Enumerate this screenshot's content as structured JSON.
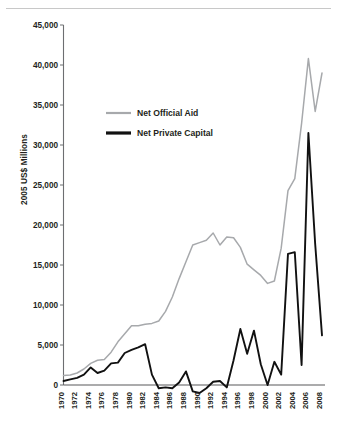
{
  "chart_data": {
    "type": "line",
    "title": "",
    "xlabel": "",
    "ylabel": "2005 US$ Millions",
    "xlim": [
      1970,
      2008
    ],
    "ylim": [
      -1500,
      45000
    ],
    "yticks": [
      0,
      5000,
      10000,
      15000,
      20000,
      25000,
      30000,
      35000,
      40000,
      45000
    ],
    "ytick_labels": [
      "0",
      "5,000",
      "10,000",
      "15,000",
      "20,000",
      "25,000",
      "30,000",
      "35,000",
      "40,000",
      "45,000"
    ],
    "xticks": [
      1970,
      1972,
      1974,
      1976,
      1978,
      1980,
      1982,
      1984,
      1986,
      1988,
      1990,
      1992,
      1994,
      1996,
      1998,
      2000,
      2002,
      2004,
      2006,
      2008
    ],
    "xtick_labels": [
      "1970",
      "1972",
      "1974",
      "1976",
      "1978",
      "1980",
      "1982",
      "1984",
      "1986",
      "1988",
      "1990",
      "1992",
      "1994",
      "1996",
      "1998",
      "2000",
      "2002",
      "2004",
      "2006",
      "2008"
    ],
    "grid": false,
    "legend_position": "upper-left-inside",
    "x": [
      1970,
      1971,
      1972,
      1973,
      1974,
      1975,
      1976,
      1977,
      1978,
      1979,
      1980,
      1981,
      1982,
      1983,
      1984,
      1985,
      1986,
      1987,
      1988,
      1989,
      1990,
      1991,
      1992,
      1993,
      1994,
      1995,
      1996,
      1997,
      1998,
      1999,
      2000,
      2001,
      2002,
      2003,
      2004,
      2005,
      2006,
      2007,
      2008
    ],
    "series": [
      {
        "name": "Net Official Aid",
        "color": "#a7a9ac",
        "values": [
          1200,
          1250,
          1500,
          2000,
          2700,
          3100,
          3200,
          4100,
          5400,
          6400,
          7400,
          7400,
          7600,
          7700,
          8000,
          9200,
          11000,
          13300,
          15400,
          17500,
          17800,
          18100,
          19000,
          17500,
          18500,
          18400,
          17200,
          15100,
          14400,
          13700,
          12700,
          13000,
          17100,
          24300,
          25800,
          32700,
          40800,
          34200,
          39000
        ]
      },
      {
        "name": "Net Private Capital",
        "color": "#111111",
        "values": [
          500,
          700,
          900,
          1300,
          2200,
          1500,
          1800,
          2700,
          2800,
          4000,
          4400,
          4700,
          5100,
          1300,
          -400,
          -300,
          -400,
          300,
          1700,
          -800,
          -1000,
          -400,
          400,
          500,
          -300,
          3100,
          7000,
          3900,
          6800,
          2600,
          0,
          2900,
          1300,
          16400,
          16600,
          2500,
          31500,
          17600,
          6200
        ]
      }
    ],
    "legend": [
      {
        "label": "Net Official Aid",
        "style": "thin-gray-line"
      },
      {
        "label": "Net Private Capital",
        "style": "thick-black-line"
      }
    ]
  }
}
